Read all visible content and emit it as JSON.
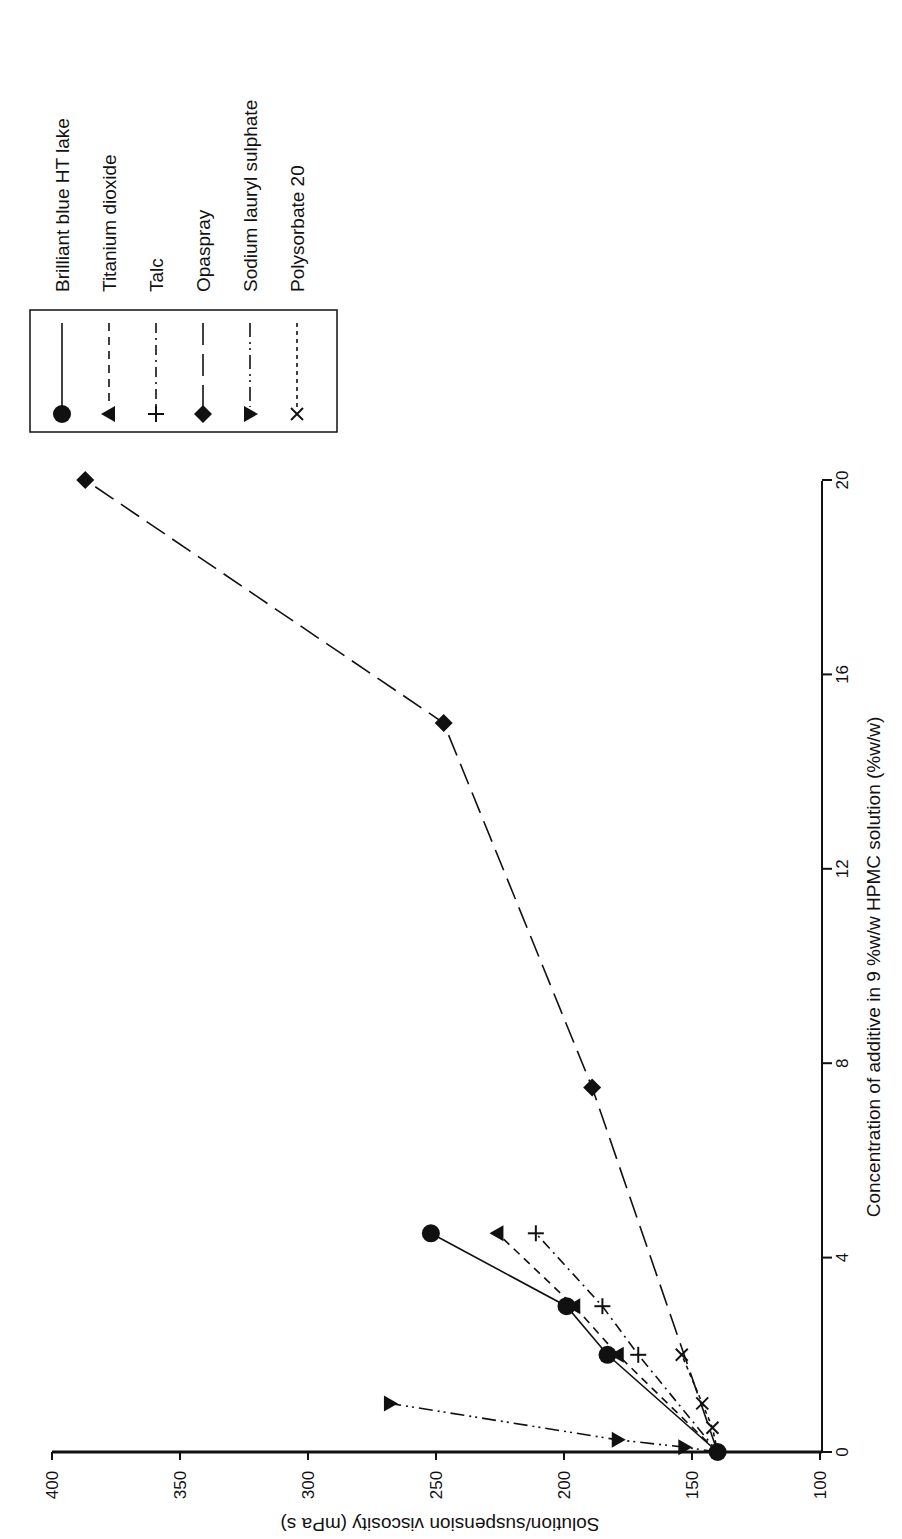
{
  "chart_data": {
    "type": "line",
    "orientation": "rotated-90-ccw",
    "title": "",
    "xlabel": "Concentration of additive in 9 %w/w HPMC solution (%w/w)",
    "ylabel": "Solution/suspension viscosity (mPa s)",
    "xlim": [
      0,
      20
    ],
    "ylim": [
      100,
      400
    ],
    "x_ticks": [
      0,
      4,
      8,
      12,
      16,
      20
    ],
    "y_ticks": [
      100,
      150,
      200,
      250,
      300,
      350,
      400
    ],
    "grid": false,
    "legend_position": "upper-left (in rotated frame: top-right)",
    "series": [
      {
        "name": "Brilliant blue HT lake",
        "marker": "circle",
        "line": "solid",
        "x": [
          0,
          2,
          3,
          4.5
        ],
        "y": [
          140,
          183,
          199,
          252
        ]
      },
      {
        "name": "Titanium dioxide",
        "marker": "triangle-left",
        "line": "dashed",
        "x": [
          0,
          2,
          3,
          4.5
        ],
        "y": [
          140,
          179,
          196,
          226
        ]
      },
      {
        "name": "Talc",
        "marker": "plus",
        "line": "dash-dot",
        "x": [
          0,
          2,
          3,
          4.5
        ],
        "y": [
          140,
          171,
          185,
          211
        ]
      },
      {
        "name": "Opaspray",
        "marker": "diamond",
        "line": "long-dash",
        "x": [
          0,
          7.5,
          15,
          20
        ],
        "y": [
          140,
          189,
          247,
          387
        ]
      },
      {
        "name": "Sodium lauryl sulphate",
        "marker": "triangle-right",
        "line": "dash-dot-dot",
        "x": [
          0,
          0.1,
          0.25,
          1
        ],
        "y": [
          140,
          153,
          179,
          268
        ]
      },
      {
        "name": "Polysorbate 20",
        "marker": "x",
        "line": "dotted",
        "x": [
          0,
          0.5,
          1,
          2
        ],
        "y": [
          140,
          142,
          146,
          154
        ]
      }
    ]
  },
  "legend": {
    "items": [
      {
        "label": "Brilliant blue HT lake"
      },
      {
        "label": "Titanium dioxide"
      },
      {
        "label": "Talc"
      },
      {
        "label": "Opaspray"
      },
      {
        "label": "Sodium lauryl sulphate"
      },
      {
        "label": "Polysorbate 20"
      }
    ]
  },
  "axes": {
    "x_tick_labels": [
      "0",
      "4",
      "8",
      "12",
      "16",
      "20"
    ],
    "y_tick_labels": [
      "100",
      "150",
      "200",
      "250",
      "300",
      "350",
      "400"
    ],
    "xlabel": "Concentration of additive in 9 %w/w HPMC solution (%w/w)",
    "ylabel": "Solution/suspension viscosity (mPa s)"
  }
}
